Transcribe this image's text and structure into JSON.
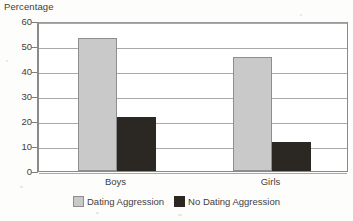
{
  "chart_data": {
    "type": "bar",
    "title": "",
    "ylabel": "Percentage",
    "xlabel": "",
    "categories": [
      "Boys",
      "Girls"
    ],
    "series": [
      {
        "name": "Dating Aggression",
        "values": [
          53.4,
          45.6
        ],
        "color": "#c9c9c9"
      },
      {
        "name": "No Dating Aggression",
        "values": [
          21.6,
          11.6
        ],
        "color": "#2b2722"
      }
    ],
    "ylim": [
      0,
      60
    ],
    "yticks": [
      0,
      10,
      20,
      30,
      40,
      50,
      60
    ],
    "ytick_labels": [
      "0",
      "10",
      "20",
      "30",
      "40",
      "50",
      "60"
    ],
    "grid": true,
    "legend_position": "bottom"
  },
  "axis": {
    "y_title": "Percentage"
  },
  "legend": {
    "items": [
      {
        "label": "Dating Aggression",
        "color": "#c9c9c9"
      },
      {
        "label": "No Dating Aggression",
        "color": "#2b2722"
      }
    ]
  }
}
